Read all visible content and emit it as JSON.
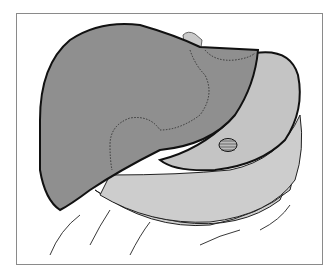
{
  "illustration": {
    "subject": "anatomical drawing of liver overlying stomach and intestines",
    "colors": {
      "liver_fill": "#8f8f8f",
      "stomach_fill": "#c4c4c4",
      "intestine_fill": "#d2d2d2",
      "outline": "#1a1a1a",
      "frame": "#8a8a8a",
      "background": "#ffffff"
    },
    "regions": [
      "liver",
      "stomach",
      "esophagus",
      "greater-omentum",
      "intestines",
      "hatched-lesion"
    ]
  }
}
